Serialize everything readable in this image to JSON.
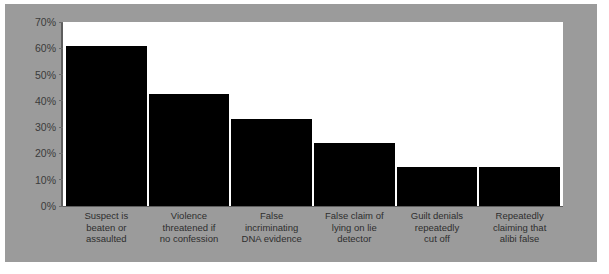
{
  "chart_data": {
    "type": "bar",
    "title": "",
    "xlabel": "",
    "ylabel": "",
    "ylim": [
      0,
      70
    ],
    "grid": false,
    "legend": false,
    "y_ticks": [
      "70%",
      "60%",
      "50%",
      "40%",
      "30%",
      "20%",
      "10%",
      "0%"
    ],
    "y_tick_values": [
      70,
      60,
      50,
      40,
      30,
      20,
      10,
      0
    ],
    "categories": [
      "Suspect is beaten or assaulted",
      "Violence threatened if no confession",
      "False incriminating DNA evidence",
      "False claim of lying on lie detector",
      "Guilt denials repeatedly cut off",
      "Repeatedly claiming that alibi false"
    ],
    "category_lines": [
      [
        "Suspect is",
        "beaten or",
        "assaulted"
      ],
      [
        "Violence",
        "threatened if",
        "no confession"
      ],
      [
        "False",
        "incriminating",
        "DNA evidence"
      ],
      [
        "False claim of",
        "lying on lie",
        "detector"
      ],
      [
        "Guilt denials",
        "repeatedly",
        "cut off"
      ],
      [
        "Repeatedly",
        "claiming that",
        "alibi false"
      ]
    ],
    "values": [
      61,
      42.5,
      33,
      24,
      15,
      15
    ],
    "bar_color": "#000000",
    "plot_background": "#ffffff",
    "figure_background": "#9b9b9b",
    "axis_color": "#5d5d5d",
    "tick_label_color": "#3a3a3a"
  }
}
